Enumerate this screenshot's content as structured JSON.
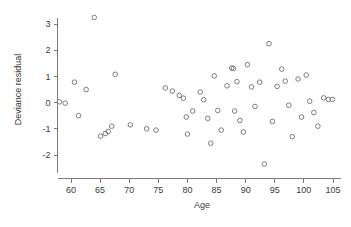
{
  "chart_data": {
    "type": "scatter",
    "title": "",
    "xlabel": "Age",
    "ylabel": "Deviance residual",
    "xlim": [
      57.5,
      106.5
    ],
    "ylim": [
      -2.6,
      3.45
    ],
    "grid": false,
    "legend": null,
    "x_ticks": [
      60,
      65,
      70,
      75,
      80,
      85,
      90,
      95,
      100,
      105
    ],
    "y_ticks": [
      -2,
      -1,
      0,
      1,
      2,
      3
    ],
    "x_tick_labels": [
      "60",
      "65",
      "70",
      "75",
      "80",
      "85",
      "90",
      "95",
      "100",
      "105"
    ],
    "y_tick_labels": [
      "-2",
      "-1",
      "0",
      "1",
      "2",
      "3"
    ],
    "marker": "open-circle",
    "marker_color": "#6e6e6e",
    "points": [
      {
        "x": 58.0,
        "y": 0.03
      },
      {
        "x": 59.0,
        "y": -0.02
      },
      {
        "x": 60.6,
        "y": 0.78
      },
      {
        "x": 61.3,
        "y": -0.5
      },
      {
        "x": 62.6,
        "y": 0.5
      },
      {
        "x": 64.0,
        "y": 3.25
      },
      {
        "x": 65.1,
        "y": -1.28
      },
      {
        "x": 65.9,
        "y": -1.18
      },
      {
        "x": 66.4,
        "y": -1.1
      },
      {
        "x": 67.0,
        "y": -0.9
      },
      {
        "x": 67.6,
        "y": 1.08
      },
      {
        "x": 70.2,
        "y": -0.85
      },
      {
        "x": 73.0,
        "y": -1.0
      },
      {
        "x": 74.6,
        "y": -1.05
      },
      {
        "x": 76.2,
        "y": 0.56
      },
      {
        "x": 77.4,
        "y": 0.44
      },
      {
        "x": 78.6,
        "y": 0.27
      },
      {
        "x": 79.3,
        "y": 0.17
      },
      {
        "x": 79.8,
        "y": -0.55
      },
      {
        "x": 80.0,
        "y": -1.2
      },
      {
        "x": 80.9,
        "y": -0.32
      },
      {
        "x": 82.2,
        "y": 0.4
      },
      {
        "x": 82.8,
        "y": 0.11
      },
      {
        "x": 83.5,
        "y": -0.6
      },
      {
        "x": 84.0,
        "y": -1.55
      },
      {
        "x": 84.6,
        "y": 1.02
      },
      {
        "x": 85.2,
        "y": -0.3
      },
      {
        "x": 85.8,
        "y": -1.05
      },
      {
        "x": 86.8,
        "y": 0.64
      },
      {
        "x": 87.6,
        "y": 1.32
      },
      {
        "x": 87.9,
        "y": 1.3
      },
      {
        "x": 88.1,
        "y": -0.32
      },
      {
        "x": 88.5,
        "y": 0.8
      },
      {
        "x": 89.0,
        "y": -0.68
      },
      {
        "x": 89.6,
        "y": -1.12
      },
      {
        "x": 90.3,
        "y": 1.45
      },
      {
        "x": 91.0,
        "y": 0.6
      },
      {
        "x": 91.6,
        "y": -0.15
      },
      {
        "x": 92.4,
        "y": 0.78
      },
      {
        "x": 93.2,
        "y": -2.35
      },
      {
        "x": 94.0,
        "y": 2.25
      },
      {
        "x": 94.6,
        "y": -0.72
      },
      {
        "x": 95.4,
        "y": 0.62
      },
      {
        "x": 96.2,
        "y": 1.28
      },
      {
        "x": 96.8,
        "y": 0.82
      },
      {
        "x": 97.4,
        "y": -0.1
      },
      {
        "x": 98.0,
        "y": -1.3
      },
      {
        "x": 99.0,
        "y": 0.9
      },
      {
        "x": 99.6,
        "y": -0.55
      },
      {
        "x": 100.4,
        "y": 1.05
      },
      {
        "x": 101.0,
        "y": 0.05
      },
      {
        "x": 101.7,
        "y": -0.38
      },
      {
        "x": 102.4,
        "y": -0.9
      },
      {
        "x": 103.4,
        "y": 0.18
      },
      {
        "x": 104.2,
        "y": 0.12
      },
      {
        "x": 104.9,
        "y": 0.12
      }
    ]
  }
}
